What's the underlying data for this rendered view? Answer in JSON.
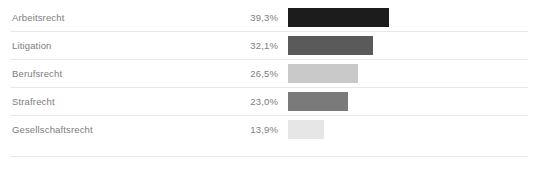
{
  "chart_data": {
    "type": "bar",
    "title": "",
    "subtitle": "",
    "xlabel": "",
    "ylabel": "",
    "orientation": "horizontal",
    "grid": false,
    "legend": "none",
    "value_suffix": "%",
    "decimal_separator": ",",
    "categories": [
      "Arbeitsrecht",
      "Litigation",
      "Berufsrecht",
      "Strafrecht",
      "Gesellschaftsrecht"
    ],
    "values": [
      39.3,
      32.1,
      26.5,
      23.0,
      13.9
    ],
    "value_labels": [
      "39,3%",
      "32,1%",
      "26,5%",
      "23,0%",
      "13,9%"
    ],
    "bar_colors": [
      "#1c1c1c",
      "#5a5a5a",
      "#c9c9c9",
      "#7a7a7a",
      "#e6e6e6"
    ],
    "bar_pixel_widths": [
      101,
      85,
      70,
      60,
      36
    ],
    "rows": [
      {
        "label": "Arbeitsrecht",
        "value_label": "39,3%",
        "value": 39.3,
        "color": "#1c1c1c",
        "bar_width": "101px"
      },
      {
        "label": "Litigation",
        "value_label": "32,1%",
        "value": 32.1,
        "color": "#5a5a5a",
        "bar_width": "85px"
      },
      {
        "label": "Berufsrecht",
        "value_label": "26,5%",
        "value": 26.5,
        "color": "#c9c9c9",
        "bar_width": "70px"
      },
      {
        "label": "Strafrecht",
        "value_label": "23,0%",
        "value": 23.0,
        "color": "#7a7a7a",
        "bar_width": "60px"
      },
      {
        "label": "Gesellschaftsrecht",
        "value_label": "13,9%",
        "value": 13.9,
        "color": "#e6e6e6",
        "bar_width": "36px"
      }
    ]
  },
  "theme": {
    "background": "#ffffff",
    "text_color": "#7d7d7d",
    "separator_color": "#e8e8e8"
  }
}
